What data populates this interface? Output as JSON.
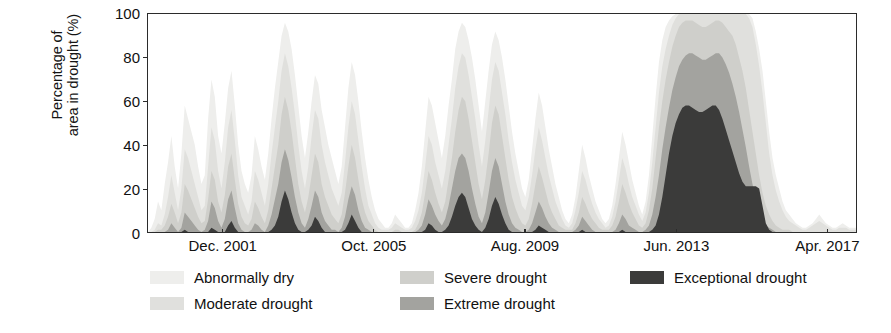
{
  "chart_data": {
    "type": "area",
    "stacked": true,
    "title": "",
    "subtitle": "",
    "xlabel": "",
    "ylabel": "Percentage of area in drought (%)",
    "ylabel_lines": [
      "Percentage of",
      "area in drought (%)"
    ],
    "ylim": [
      0,
      100
    ],
    "yticks": [
      0,
      20,
      40,
      60,
      80,
      100
    ],
    "ytick_labels": [
      "0",
      "20",
      "40",
      "60",
      "80",
      "100"
    ],
    "xlim": [
      2000.0,
      2018.0
    ],
    "xticks": [
      2001.92,
      2005.75,
      2009.58,
      2013.42,
      2017.25
    ],
    "xtick_labels": [
      "Dec. 2001",
      "Oct. 2005",
      "Aug. 2009",
      "Jun. 2013",
      "Apr. 2017"
    ],
    "grid": false,
    "legend_position": "below-plot",
    "series": [
      {
        "name": "Abnormally dry",
        "color": "#eeeeec",
        "values": [
          0,
          2,
          6,
          14,
          10,
          22,
          32,
          44,
          30,
          20,
          36,
          58,
          52,
          46,
          40,
          30,
          22,
          26,
          52,
          70,
          62,
          44,
          36,
          50,
          66,
          74,
          58,
          40,
          28,
          22,
          18,
          26,
          44,
          38,
          30,
          24,
          36,
          52,
          66,
          78,
          90,
          96,
          92,
          84,
          72,
          58,
          44,
          34,
          46,
          60,
          72,
          68,
          56,
          48,
          40,
          34,
          28,
          22,
          30,
          48,
          66,
          78,
          72,
          60,
          46,
          34,
          24,
          16,
          10,
          6,
          4,
          2,
          2,
          4,
          8,
          6,
          4,
          2,
          2,
          4,
          10,
          18,
          30,
          46,
          62,
          58,
          50,
          42,
          34,
          44,
          58,
          70,
          84,
          92,
          96,
          94,
          88,
          80,
          70,
          58,
          46,
          60,
          74,
          86,
          92,
          88,
          80,
          70,
          58,
          46,
          36,
          28,
          20,
          16,
          24,
          38,
          52,
          64,
          58,
          48,
          38,
          30,
          22,
          16,
          10,
          6,
          4,
          8,
          16,
          28,
          40,
          34,
          26,
          20,
          14,
          10,
          6,
          4,
          6,
          12,
          22,
          34,
          46,
          40,
          32,
          24,
          18,
          12,
          8,
          14,
          26,
          44,
          62,
          78,
          88,
          94,
          97,
          99,
          100,
          100,
          100,
          100,
          100,
          100,
          100,
          100,
          100,
          100,
          100,
          100,
          100,
          100,
          100,
          100,
          100,
          100,
          100,
          100,
          100,
          100,
          100,
          98,
          92,
          84,
          74,
          60,
          46,
          34,
          26,
          20,
          14,
          10,
          8,
          6,
          4,
          3,
          2,
          2,
          3,
          4,
          6,
          8,
          6,
          4,
          3,
          2,
          2,
          3,
          4,
          3,
          2,
          2,
          2
        ]
      },
      {
        "name": "Moderate drought",
        "color": "#e0e0dd",
        "values": [
          0,
          0,
          1,
          4,
          3,
          8,
          16,
          26,
          18,
          10,
          20,
          38,
          34,
          28,
          22,
          16,
          10,
          12,
          30,
          48,
          42,
          28,
          20,
          32,
          48,
          56,
          42,
          26,
          16,
          12,
          8,
          14,
          28,
          24,
          18,
          12,
          22,
          36,
          48,
          60,
          74,
          82,
          76,
          66,
          54,
          40,
          28,
          20,
          30,
          44,
          56,
          52,
          40,
          32,
          26,
          20,
          16,
          12,
          18,
          32,
          48,
          60,
          54,
          42,
          30,
          20,
          12,
          8,
          4,
          2,
          1,
          1,
          1,
          2,
          4,
          3,
          2,
          1,
          1,
          2,
          5,
          10,
          18,
          30,
          44,
          40,
          32,
          26,
          20,
          28,
          40,
          52,
          66,
          76,
          82,
          80,
          72,
          62,
          52,
          40,
          30,
          42,
          56,
          70,
          78,
          74,
          64,
          54,
          42,
          32,
          24,
          18,
          12,
          10,
          16,
          26,
          38,
          48,
          42,
          34,
          26,
          20,
          14,
          10,
          6,
          3,
          2,
          4,
          10,
          18,
          28,
          24,
          18,
          13,
          9,
          6,
          4,
          2,
          3,
          7,
          14,
          24,
          34,
          29,
          22,
          16,
          12,
          8,
          5,
          9,
          18,
          32,
          48,
          64,
          76,
          84,
          90,
          95,
          98,
          100,
          100,
          100,
          100,
          100,
          100,
          100,
          100,
          100,
          100,
          100,
          100,
          100,
          100,
          100,
          100,
          100,
          100,
          100,
          100,
          100,
          98,
          94,
          86,
          76,
          64,
          50,
          36,
          26,
          19,
          14,
          10,
          7,
          5,
          4,
          3,
          2,
          1,
          1,
          2,
          3,
          4,
          5,
          4,
          3,
          2,
          1,
          1,
          2,
          2,
          2,
          1,
          1,
          1
        ]
      },
      {
        "name": "Severe drought",
        "color": "#cfcfcb",
        "values": [
          0,
          0,
          0,
          1,
          1,
          3,
          7,
          13,
          9,
          4,
          9,
          22,
          19,
          15,
          11,
          7,
          4,
          5,
          15,
          28,
          24,
          14,
          9,
          17,
          30,
          36,
          24,
          13,
          7,
          4,
          3,
          6,
          14,
          11,
          7,
          4,
          10,
          20,
          30,
          40,
          54,
          62,
          56,
          46,
          34,
          22,
          14,
          9,
          16,
          26,
          36,
          32,
          22,
          16,
          12,
          8,
          6,
          4,
          8,
          18,
          30,
          40,
          34,
          24,
          15,
          9,
          5,
          3,
          1,
          0,
          0,
          0,
          0,
          0,
          1,
          1,
          0,
          0,
          0,
          0,
          1,
          4,
          9,
          18,
          28,
          24,
          18,
          13,
          9,
          14,
          24,
          34,
          46,
          56,
          62,
          60,
          52,
          42,
          32,
          22,
          15,
          24,
          36,
          50,
          58,
          54,
          44,
          34,
          24,
          16,
          11,
          7,
          4,
          3,
          6,
          13,
          22,
          30,
          25,
          19,
          13,
          9,
          6,
          3,
          2,
          1,
          1,
          1,
          4,
          9,
          16,
          13,
          9,
          6,
          4,
          2,
          1,
          1,
          1,
          3,
          7,
          14,
          22,
          18,
          13,
          9,
          6,
          3,
          2,
          4,
          10,
          20,
          34,
          48,
          60,
          70,
          78,
          85,
          90,
          94,
          96,
          97,
          97,
          97,
          96,
          95,
          94,
          94,
          95,
          96,
          97,
          97,
          96,
          94,
          92,
          90,
          86,
          80,
          74,
          66,
          56,
          46,
          36,
          26,
          18,
          12,
          8,
          5,
          3,
          2,
          1,
          1,
          1,
          0,
          0,
          0,
          0,
          0,
          0,
          0,
          0,
          0,
          0,
          0,
          0,
          0,
          0,
          0,
          0,
          0,
          0
        ]
      },
      {
        "name": "Extreme drought",
        "color": "#a3a39f",
        "values": [
          0,
          0,
          0,
          0,
          0,
          0,
          1,
          4,
          2,
          0,
          2,
          9,
          7,
          5,
          3,
          1,
          0,
          1,
          5,
          14,
          11,
          5,
          2,
          6,
          15,
          19,
          11,
          4,
          1,
          0,
          0,
          1,
          4,
          3,
          1,
          0,
          3,
          8,
          15,
          22,
          32,
          38,
          33,
          25,
          16,
          9,
          4,
          2,
          6,
          12,
          19,
          16,
          9,
          5,
          3,
          1,
          1,
          0,
          2,
          7,
          15,
          21,
          17,
          10,
          5,
          2,
          1,
          0,
          0,
          0,
          0,
          0,
          0,
          0,
          0,
          0,
          0,
          0,
          0,
          0,
          0,
          1,
          3,
          8,
          15,
          12,
          8,
          5,
          3,
          6,
          12,
          20,
          28,
          34,
          36,
          34,
          28,
          20,
          13,
          7,
          4,
          9,
          18,
          28,
          34,
          30,
          22,
          14,
          8,
          4,
          2,
          1,
          0,
          0,
          1,
          4,
          9,
          14,
          11,
          7,
          4,
          2,
          1,
          0,
          0,
          0,
          0,
          0,
          1,
          3,
          7,
          5,
          3,
          1,
          0,
          0,
          0,
          0,
          0,
          0,
          1,
          4,
          8,
          6,
          3,
          2,
          1,
          0,
          0,
          1,
          3,
          8,
          16,
          26,
          38,
          48,
          57,
          65,
          71,
          76,
          79,
          81,
          82,
          82,
          81,
          80,
          79,
          79,
          80,
          81,
          82,
          82,
          80,
          77,
          73,
          68,
          62,
          55,
          47,
          39,
          30,
          22,
          15,
          10,
          6,
          3,
          2,
          1,
          0,
          0,
          0,
          0,
          0,
          0,
          0,
          0,
          0,
          0,
          0,
          0,
          0,
          0,
          0,
          0,
          0,
          0,
          0,
          0
        ]
      },
      {
        "name": "Exceptional drought",
        "color": "#3b3b3a",
        "values": [
          0,
          0,
          0,
          0,
          0,
          0,
          0,
          0,
          0,
          0,
          0,
          1,
          0,
          0,
          0,
          0,
          0,
          0,
          0,
          2,
          1,
          0,
          0,
          0,
          3,
          5,
          2,
          0,
          0,
          0,
          0,
          0,
          0,
          0,
          0,
          0,
          0,
          1,
          3,
          7,
          14,
          19,
          15,
          9,
          4,
          1,
          0,
          0,
          1,
          3,
          7,
          5,
          2,
          0,
          0,
          0,
          0,
          0,
          0,
          1,
          4,
          8,
          5,
          2,
          0,
          0,
          0,
          0,
          0,
          0,
          0,
          0,
          0,
          0,
          0,
          0,
          0,
          0,
          0,
          0,
          0,
          0,
          0,
          1,
          4,
          3,
          1,
          0,
          0,
          1,
          3,
          7,
          12,
          16,
          18,
          16,
          11,
          6,
          3,
          1,
          0,
          2,
          6,
          12,
          16,
          13,
          8,
          4,
          1,
          0,
          0,
          0,
          0,
          0,
          0,
          0,
          1,
          3,
          2,
          1,
          0,
          0,
          0,
          0,
          0,
          0,
          0,
          0,
          0,
          0,
          1,
          0,
          0,
          0,
          0,
          0,
          0,
          0,
          0,
          0,
          0,
          0,
          1,
          0,
          0,
          0,
          0,
          0,
          0,
          0,
          0,
          1,
          3,
          8,
          16,
          26,
          36,
          44,
          50,
          54,
          57,
          58,
          58,
          57,
          56,
          55,
          55,
          56,
          57,
          58,
          58,
          56,
          52,
          47,
          42,
          37,
          32,
          27,
          23,
          21,
          21,
          21,
          21,
          20,
          12,
          4,
          1,
          0,
          0,
          0,
          0,
          0,
          0,
          0,
          0,
          0,
          0,
          0,
          0,
          0,
          0,
          0,
          0,
          0,
          0,
          0,
          0
        ]
      }
    ]
  },
  "legend": {
    "items": [
      {
        "label": "Abnormally dry",
        "color": "#eeeeec",
        "row": 0,
        "col": 0
      },
      {
        "label": "Moderate drought",
        "color": "#e0e0dd",
        "row": 1,
        "col": 0
      },
      {
        "label": "Severe drought",
        "color": "#cfcfcb",
        "row": 0,
        "col": 1
      },
      {
        "label": "Extreme drought",
        "color": "#a3a39f",
        "row": 1,
        "col": 1
      },
      {
        "label": "Exceptional drought",
        "color": "#3b3b3a",
        "row": 0,
        "col": 2
      }
    ]
  }
}
